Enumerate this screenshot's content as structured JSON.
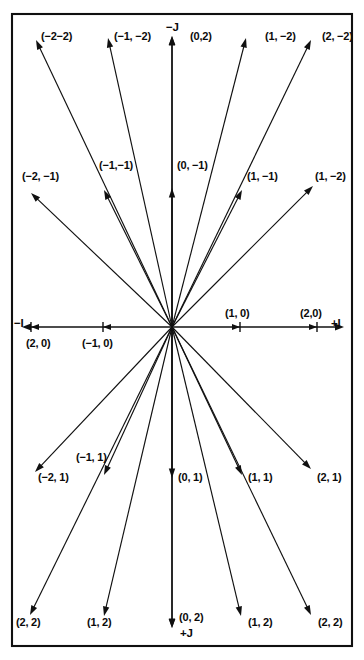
{
  "figure": {
    "type": "vector-direction-diagram",
    "origin": {
      "x": 172,
      "y": 327
    },
    "frame": {
      "x": 12,
      "y": 14,
      "width": 340,
      "height": 632
    },
    "line_color": "#101010",
    "background_color": "#ffffff"
  },
  "axes": {
    "horizontal": {
      "negative_label": "−I",
      "positive_label": "+I",
      "start_x": 22,
      "end_x": 344,
      "y": 327
    },
    "vertical": {
      "negative_label": "−J",
      "positive_label": "+J",
      "start_y": 36,
      "end_y": 628,
      "x": 172
    }
  },
  "axis_ticks": [
    {
      "name": "tick-neg-i-2",
      "label": "(2, 0)",
      "x": 31,
      "y": 327,
      "label_x": 26,
      "label_y": 338
    },
    {
      "name": "tick-neg-i-1",
      "label": "(−1, 0)",
      "x": 103,
      "y": 327,
      "label_x": 82,
      "label_y": 338
    },
    {
      "name": "tick-pos-i-1",
      "label": "(1, 0)",
      "x": 240,
      "y": 327,
      "label_x": 225,
      "label_y": 308
    },
    {
      "name": "tick-pos-i-2",
      "label": "(2,0)",
      "x": 317,
      "y": 327,
      "label_x": 300,
      "label_y": 308
    }
  ],
  "chart_data": {
    "type": "scatter",
    "title": "",
    "xlabel": "I",
    "ylabel": "J",
    "rays": [
      {
        "id": "r-top-1",
        "label": "(−2−2)",
        "tip_x": 36,
        "tip_y": 40,
        "label_x": 41,
        "label_y": 31,
        "quadrant": "upper-left"
      },
      {
        "id": "r-top-2",
        "label": "(−1, −2)",
        "tip_x": 108,
        "tip_y": 38,
        "label_x": 114,
        "label_y": 31,
        "quadrant": "upper-left"
      },
      {
        "id": "r-top-3",
        "label": "(0,2)",
        "tip_x": 172,
        "tip_y": 36,
        "label_x": 190,
        "label_y": 31,
        "quadrant": "up"
      },
      {
        "id": "r-top-4",
        "label": "(1, −2)",
        "tip_x": 246,
        "tip_y": 38,
        "label_x": 265,
        "label_y": 31,
        "quadrant": "upper-right"
      },
      {
        "id": "r-top-5",
        "label": "(2, −2)",
        "tip_x": 311,
        "tip_y": 40,
        "label_x": 322,
        "label_y": 31,
        "quadrant": "upper-right"
      },
      {
        "id": "r-mid-up-1",
        "label": "(−2, −1)",
        "tip_x": 31,
        "tip_y": 193,
        "label_x": 22,
        "label_y": 171,
        "quadrant": "upper-left"
      },
      {
        "id": "r-mid-up-2",
        "label": "(−1,−1)",
        "tip_x": 104,
        "tip_y": 190,
        "label_x": 99,
        "label_y": 160,
        "quadrant": "upper-left"
      },
      {
        "id": "r-mid-up-3",
        "label": "(0, −1)",
        "tip_x": 172,
        "tip_y": 188,
        "label_x": 177,
        "label_y": 160,
        "quadrant": "up"
      },
      {
        "id": "r-mid-up-4",
        "label": "(1, −1)",
        "tip_x": 242,
        "tip_y": 190,
        "label_x": 247,
        "label_y": 171,
        "quadrant": "upper-right"
      },
      {
        "id": "r-mid-up-5",
        "label": "(1, −2)",
        "tip_x": 313,
        "tip_y": 186,
        "label_x": 315,
        "label_y": 171,
        "quadrant": "upper-right"
      },
      {
        "id": "r-mid-dn-1",
        "label": "(−2, 1)",
        "tip_x": 35,
        "tip_y": 472,
        "label_x": 38,
        "label_y": 472,
        "quadrant": "lower-left"
      },
      {
        "id": "r-mid-dn-2",
        "label": "(−1, 1)",
        "tip_x": 104,
        "tip_y": 475,
        "label_x": 76,
        "label_y": 452,
        "quadrant": "lower-left"
      },
      {
        "id": "r-mid-dn-3",
        "label": "(0, 1)",
        "tip_x": 172,
        "tip_y": 478,
        "label_x": 178,
        "label_y": 472,
        "quadrant": "down"
      },
      {
        "id": "r-mid-dn-4",
        "label": "(1, 1)",
        "tip_x": 242,
        "tip_y": 475,
        "label_x": 248,
        "label_y": 472,
        "quadrant": "lower-right"
      },
      {
        "id": "r-mid-dn-5",
        "label": "(2, 1)",
        "tip_x": 311,
        "tip_y": 469,
        "label_x": 317,
        "label_y": 472,
        "quadrant": "lower-right"
      },
      {
        "id": "r-bot-1",
        "label": "(2, 2)",
        "tip_x": 30,
        "tip_y": 615,
        "label_x": 16,
        "label_y": 617,
        "quadrant": "lower-left"
      },
      {
        "id": "r-bot-2",
        "label": "(1, 2)",
        "tip_x": 104,
        "tip_y": 616,
        "label_x": 87,
        "label_y": 617,
        "quadrant": "lower-left"
      },
      {
        "id": "r-bot-3",
        "label": "(0, 2)",
        "tip_x": 172,
        "tip_y": 628,
        "label_x": 179,
        "label_y": 612,
        "quadrant": "down"
      },
      {
        "id": "r-bot-4",
        "label": "(1, 2)",
        "tip_x": 241,
        "tip_y": 616,
        "label_x": 248,
        "label_y": 617,
        "quadrant": "lower-right"
      },
      {
        "id": "r-bot-5",
        "label": "(2, 2)",
        "tip_x": 311,
        "tip_y": 615,
        "label_x": 318,
        "label_y": 617,
        "quadrant": "lower-right"
      }
    ]
  }
}
